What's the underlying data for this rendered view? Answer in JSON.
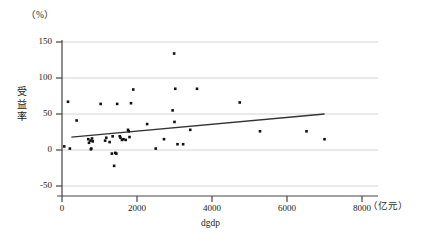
{
  "chart_data": {
    "type": "scatter",
    "title": "",
    "xlabel": "dgdp",
    "ylabel": "受益率",
    "x_unit": "（亿元）",
    "y_unit": "（%）",
    "xlim": [
      0,
      8000
    ],
    "ylim": [
      -50,
      150
    ],
    "xticks": [
      0,
      2000,
      4000,
      6000,
      8000
    ],
    "yticks": [
      -50,
      0,
      50,
      100,
      150
    ],
    "xtick_labels": [
      "0",
      "2000",
      "4000",
      "6000",
      "8000"
    ],
    "ytick_labels": [
      "-50",
      "0",
      "50",
      "100",
      "150"
    ],
    "grid": "horizontal",
    "legend": "none",
    "marker": "filled-square",
    "marker_color": "#111111",
    "points": [
      {
        "x": 60,
        "y": 5
      },
      {
        "x": 160,
        "y": 67
      },
      {
        "x": 210,
        "y": 2
      },
      {
        "x": 390,
        "y": 41
      },
      {
        "x": 700,
        "y": 15
      },
      {
        "x": 720,
        "y": 10
      },
      {
        "x": 760,
        "y": 13
      },
      {
        "x": 770,
        "y": 1
      },
      {
        "x": 780,
        "y": 2
      },
      {
        "x": 800,
        "y": 16
      },
      {
        "x": 820,
        "y": 12
      },
      {
        "x": 1030,
        "y": 64
      },
      {
        "x": 1150,
        "y": 13
      },
      {
        "x": 1180,
        "y": 17
      },
      {
        "x": 1270,
        "y": 11
      },
      {
        "x": 1330,
        "y": -5
      },
      {
        "x": 1350,
        "y": 19
      },
      {
        "x": 1390,
        "y": -22
      },
      {
        "x": 1420,
        "y": -4
      },
      {
        "x": 1450,
        "y": -5
      },
      {
        "x": 1470,
        "y": 64
      },
      {
        "x": 1540,
        "y": 19
      },
      {
        "x": 1560,
        "y": 17
      },
      {
        "x": 1600,
        "y": 14
      },
      {
        "x": 1640,
        "y": 15
      },
      {
        "x": 1700,
        "y": 14
      },
      {
        "x": 1760,
        "y": 28
      },
      {
        "x": 1780,
        "y": 26
      },
      {
        "x": 1800,
        "y": 18
      },
      {
        "x": 1840,
        "y": 65
      },
      {
        "x": 1900,
        "y": 84
      },
      {
        "x": 2270,
        "y": 36
      },
      {
        "x": 2500,
        "y": 2
      },
      {
        "x": 2720,
        "y": 15
      },
      {
        "x": 2950,
        "y": 55
      },
      {
        "x": 2990,
        "y": 134
      },
      {
        "x": 3000,
        "y": 39
      },
      {
        "x": 3020,
        "y": 85
      },
      {
        "x": 3080,
        "y": 8
      },
      {
        "x": 3230,
        "y": 8
      },
      {
        "x": 3420,
        "y": 28
      },
      {
        "x": 3600,
        "y": 85
      },
      {
        "x": 4740,
        "y": 66
      },
      {
        "x": 5280,
        "y": 26
      },
      {
        "x": 6520,
        "y": 26
      },
      {
        "x": 7000,
        "y": 15
      }
    ],
    "fit_line": {
      "name": "linear-regression",
      "x_start": 250,
      "y_start": 18,
      "x_end": 7000,
      "y_end": 50,
      "color": "#333333"
    }
  }
}
